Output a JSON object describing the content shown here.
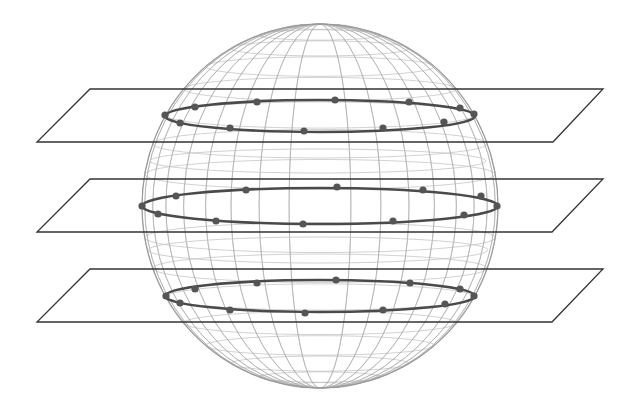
{
  "canvas": {
    "width": 636,
    "height": 412,
    "background": "#ffffff"
  },
  "colors": {
    "mesh": "#a8a8a8",
    "mesh_faint": "#c4c4c4",
    "sphere_outline": "#9a9a9a",
    "plane": "#333333",
    "ring": "#4a4a4a",
    "dot": "#555555"
  },
  "sphere": {
    "cx": 320,
    "cy": 206,
    "rx": 178,
    "ry": 182,
    "meridian_count": 36,
    "latitudes_deg": [
      -80,
      -70,
      -60,
      -50,
      -40,
      -30,
      -20,
      -10,
      10,
      20,
      30,
      40,
      50,
      60,
      70,
      80
    ],
    "tilt": 0.085
  },
  "planes": [
    {
      "id": "plane-top",
      "points": [
        [
          90,
          89
        ],
        [
          603,
          89
        ],
        [
          553,
          142
        ],
        [
          37,
          142
        ]
      ]
    },
    {
      "id": "plane-middle",
      "points": [
        [
          90,
          179
        ],
        [
          603,
          179
        ],
        [
          552,
          232
        ],
        [
          37,
          232
        ]
      ]
    },
    {
      "id": "plane-bottom",
      "points": [
        [
          90,
          269
        ],
        [
          603,
          269
        ],
        [
          552,
          322
        ],
        [
          37,
          322
        ]
      ]
    }
  ],
  "rings": [
    {
      "id": "ring-top",
      "cx": 320,
      "cy": 116,
      "rx": 155,
      "ry": 16,
      "dots": [
        [
          165,
          115
        ],
        [
          195,
          107
        ],
        [
          257,
          102
        ],
        [
          335,
          100
        ],
        [
          409,
          102
        ],
        [
          460,
          108
        ],
        [
          474,
          114
        ],
        [
          444,
          122
        ],
        [
          383,
          128
        ],
        [
          304,
          131
        ],
        [
          230,
          128
        ],
        [
          180,
          123
        ]
      ]
    },
    {
      "id": "ring-middle",
      "cx": 320,
      "cy": 206,
      "rx": 178,
      "ry": 18,
      "dots": [
        [
          142,
          206
        ],
        [
          176,
          196
        ],
        [
          246,
          190
        ],
        [
          337,
          187
        ],
        [
          423,
          190
        ],
        [
          481,
          196
        ],
        [
          497,
          206
        ],
        [
          464,
          215
        ],
        [
          393,
          221
        ],
        [
          303,
          224
        ],
        [
          216,
          221
        ],
        [
          158,
          214
        ]
      ]
    },
    {
      "id": "ring-bottom",
      "cx": 320,
      "cy": 296,
      "rx": 155,
      "ry": 16,
      "dots": [
        [
          166,
          296
        ],
        [
          195,
          289
        ],
        [
          257,
          283
        ],
        [
          336,
          280
        ],
        [
          410,
          283
        ],
        [
          460,
          289
        ],
        [
          474,
          296
        ],
        [
          445,
          304
        ],
        [
          383,
          310
        ],
        [
          305,
          313
        ],
        [
          230,
          310
        ],
        [
          180,
          303
        ]
      ]
    }
  ],
  "faint_latitude_ellipses": [
    {
      "cx": 318,
      "cy": 161,
      "rx": 168,
      "ry": 12
    },
    {
      "cx": 318,
      "cy": 250,
      "rx": 170,
      "ry": 13
    }
  ],
  "dot_radius": 3.6,
  "ring_stroke": 2.6,
  "plane_stroke": 1.3
}
